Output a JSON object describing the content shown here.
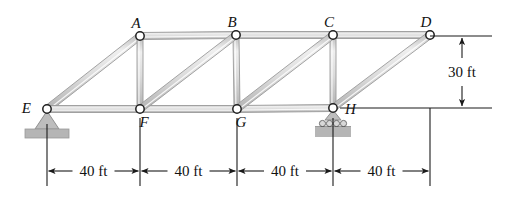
{
  "figure": {
    "type": "truss-diagram",
    "title": "",
    "background_color": "#ffffff",
    "member_fill": "#d9d9d9",
    "member_edge": "#9a9a9a",
    "line_color": "#1a1a1a",
    "support_fill": "#b3b3b3"
  },
  "joints": [
    {
      "id": "A",
      "label": "A",
      "x": 140,
      "y": 36,
      "label_dx": -4,
      "label_dy": -8,
      "chord": "top"
    },
    {
      "id": "B",
      "label": "B",
      "x": 236,
      "y": 35,
      "label_dx": -4,
      "label_dy": -8,
      "chord": "top"
    },
    {
      "id": "C",
      "label": "C",
      "x": 333,
      "y": 35,
      "label_dx": -4,
      "label_dy": -8,
      "chord": "top"
    },
    {
      "id": "D",
      "label": "D",
      "x": 430,
      "y": 35,
      "label_dx": -4,
      "label_dy": -8,
      "chord": "top"
    },
    {
      "id": "E",
      "label": "E",
      "x": 47,
      "y": 109,
      "label_dx": -16,
      "label_dy": 4,
      "chord": "bottom"
    },
    {
      "id": "F",
      "label": "F",
      "x": 140,
      "y": 109,
      "label_dx": 4,
      "label_dy": 18,
      "chord": "bottom"
    },
    {
      "id": "G",
      "label": "G",
      "x": 237,
      "y": 109,
      "label_dx": 4,
      "label_dy": 18,
      "chord": "bottom"
    },
    {
      "id": "H",
      "label": "H",
      "x": 333,
      "y": 108,
      "label_dx": 12,
      "label_dy": 6,
      "chord": "bottom"
    }
  ],
  "members": [
    {
      "id": "EA",
      "from": "E",
      "to": "A",
      "kind": "diagonal"
    },
    {
      "id": "AB",
      "from": "A",
      "to": "B",
      "kind": "top-chord"
    },
    {
      "id": "BC",
      "from": "B",
      "to": "C",
      "kind": "top-chord"
    },
    {
      "id": "CD",
      "from": "C",
      "to": "D",
      "kind": "top-chord"
    },
    {
      "id": "EF",
      "from": "E",
      "to": "F",
      "kind": "bottom-chord"
    },
    {
      "id": "FG",
      "from": "F",
      "to": "G",
      "kind": "bottom-chord"
    },
    {
      "id": "GH",
      "from": "G",
      "to": "H",
      "kind": "bottom-chord"
    },
    {
      "id": "AF",
      "from": "A",
      "to": "F",
      "kind": "vertical"
    },
    {
      "id": "BG",
      "from": "B",
      "to": "G",
      "kind": "vertical"
    },
    {
      "id": "CH",
      "from": "C",
      "to": "H",
      "kind": "vertical"
    },
    {
      "id": "FB",
      "from": "F",
      "to": "B",
      "kind": "diagonal"
    },
    {
      "id": "GC",
      "from": "G",
      "to": "C",
      "kind": "diagonal"
    },
    {
      "id": "HD",
      "from": "H",
      "to": "D",
      "kind": "diagonal"
    }
  ],
  "supports": [
    {
      "id": "support-E",
      "at": "E",
      "type": "pin",
      "x": 47,
      "y": 109
    },
    {
      "id": "support-H",
      "at": "H",
      "type": "roller",
      "x": 333,
      "y": 108,
      "rollers": 4
    }
  ],
  "dimensions": {
    "horizontal": {
      "y": 171,
      "ticks": [
        47,
        140,
        237,
        333,
        430
      ],
      "segments": [
        {
          "id": "dim-EF",
          "label": "40 ft",
          "from_x": 47,
          "to_x": 140
        },
        {
          "id": "dim-FG",
          "label": "40 ft",
          "from_x": 140,
          "to_x": 237
        },
        {
          "id": "dim-GH",
          "label": "40 ft",
          "from_x": 237,
          "to_x": 333
        },
        {
          "id": "dim-HD",
          "label": "40 ft",
          "from_x": 333,
          "to_x": 430
        }
      ]
    },
    "vertical": {
      "id": "dim-height",
      "label": "30 ft",
      "x": 462,
      "from_y": 36,
      "to_y": 108
    }
  },
  "chart_data": {
    "type": "diagram",
    "span_ft": 160,
    "height_ft": 30,
    "panel_length_ft": 40,
    "panel_count": 4,
    "joint_names": [
      "A",
      "B",
      "C",
      "D",
      "E",
      "F",
      "G",
      "H"
    ],
    "member_names": [
      "EA",
      "AB",
      "BC",
      "CD",
      "EF",
      "FG",
      "GH",
      "AF",
      "BG",
      "CH",
      "FB",
      "GC",
      "HD"
    ],
    "supports": [
      "E: pin",
      "H: roller"
    ],
    "dimension_labels": [
      "40 ft",
      "40 ft",
      "40 ft",
      "40 ft",
      "30 ft"
    ]
  }
}
